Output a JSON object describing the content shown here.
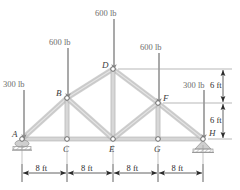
{
  "figure": {
    "type": "truss-free-body-diagram",
    "colors": {
      "member": "#c9c9c9",
      "member_edge": "#a9a9a9",
      "arrow": "#8d8d8d",
      "node_stroke": "#6a6a6a",
      "dimension": "#3a3a3a",
      "support": "#b4b4b4",
      "label": "#6e6e6e"
    },
    "nodes": [
      {
        "id": "A",
        "label": "A",
        "x": 22,
        "y": 139,
        "label_dx": -10,
        "label_dy": -4
      },
      {
        "id": "B",
        "label": "B",
        "x": 67,
        "y": 98,
        "label_dx": -11,
        "label_dy": -4
      },
      {
        "id": "C",
        "label": "C",
        "x": 67,
        "y": 139,
        "label_dx": -4,
        "label_dy": 11
      },
      {
        "id": "D",
        "label": "D",
        "x": 113,
        "y": 69,
        "label_dx": -11,
        "label_dy": -3
      },
      {
        "id": "E",
        "label": "E",
        "x": 113,
        "y": 139,
        "label_dx": -4,
        "label_dy": 11
      },
      {
        "id": "F",
        "label": "F",
        "x": 158,
        "y": 103,
        "label_dx": 5,
        "label_dy": -4
      },
      {
        "id": "G",
        "label": "G",
        "x": 158,
        "y": 139,
        "label_dx": -4,
        "label_dy": 11
      },
      {
        "id": "H",
        "label": "H",
        "x": 203,
        "y": 139,
        "label_dx": 6,
        "label_dy": -5
      }
    ],
    "members": [
      {
        "from": "A",
        "to": "C"
      },
      {
        "from": "C",
        "to": "E"
      },
      {
        "from": "E",
        "to": "G"
      },
      {
        "from": "G",
        "to": "H"
      },
      {
        "from": "A",
        "to": "B"
      },
      {
        "from": "B",
        "to": "D"
      },
      {
        "from": "D",
        "to": "F"
      },
      {
        "from": "F",
        "to": "H"
      },
      {
        "from": "B",
        "to": "C"
      },
      {
        "from": "D",
        "to": "E"
      },
      {
        "from": "F",
        "to": "G"
      },
      {
        "from": "B",
        "to": "E"
      },
      {
        "from": "E",
        "to": "F"
      }
    ],
    "loads": [
      {
        "id": "load-a",
        "label": "300 lb",
        "value": 300,
        "unit": "lb",
        "at_node": "A",
        "x": 24,
        "y_start": 90,
        "y_end": 137,
        "label_x": 3,
        "label_y": 80
      },
      {
        "id": "load-b",
        "label": "600 lb",
        "value": 600,
        "unit": "lb",
        "at_node": "B",
        "x": 68,
        "y_start": 48,
        "y_end": 96,
        "label_x": 49,
        "label_y": 38
      },
      {
        "id": "load-d",
        "label": "600 lb",
        "value": 600,
        "unit": "lb",
        "at_node": "D",
        "x": 114,
        "y_start": 19,
        "y_end": 67,
        "label_x": 95,
        "label_y": 9
      },
      {
        "id": "load-f",
        "label": "600 lb",
        "value": 600,
        "unit": "lb",
        "at_node": "F",
        "x": 159,
        "y_start": 53,
        "y_end": 101,
        "label_x": 140,
        "label_y": 43
      },
      {
        "id": "load-h",
        "label": "300 lb",
        "value": 300,
        "unit": "lb",
        "at_node": "H",
        "x": 204,
        "y_start": 90,
        "y_end": 137,
        "label_x": 183,
        "label_y": 81
      }
    ],
    "supports": [
      {
        "id": "support-a",
        "node": "A",
        "type": "roller",
        "x": 22,
        "y": 139
      },
      {
        "id": "support-h",
        "node": "H",
        "type": "pin",
        "x": 203,
        "y": 139
      }
    ],
    "horizontal_dimensions": {
      "axis_y": 173,
      "segments": [
        {
          "label": "8 ft",
          "value": 8,
          "unit": "ft",
          "x_start": 22,
          "x_end": 67
        },
        {
          "label": "8 ft",
          "value": 8,
          "unit": "ft",
          "x_start": 67,
          "x_end": 113
        },
        {
          "label": "8 ft",
          "value": 8,
          "unit": "ft",
          "x_start": 113,
          "x_end": 158
        },
        {
          "label": "8 ft",
          "value": 8,
          "unit": "ft",
          "x_start": 158,
          "x_end": 203
        }
      ]
    },
    "vertical_dimensions": {
      "axis_x": 223,
      "segments": [
        {
          "label": "6 ft",
          "value": 6,
          "unit": "ft",
          "y_start": 69,
          "y_end": 103,
          "label_x": 210,
          "label_y": 81
        },
        {
          "label": "6 ft",
          "value": 6,
          "unit": "ft",
          "y_start": 103,
          "y_end": 139,
          "label_x": 210,
          "label_y": 116
        }
      ],
      "extension_lines": [
        {
          "y": 69,
          "x_start": 118,
          "x_end": 232
        },
        {
          "y": 103,
          "x_start": 163,
          "x_end": 232
        },
        {
          "y": 139,
          "x_start": 208,
          "x_end": 232
        }
      ]
    }
  }
}
